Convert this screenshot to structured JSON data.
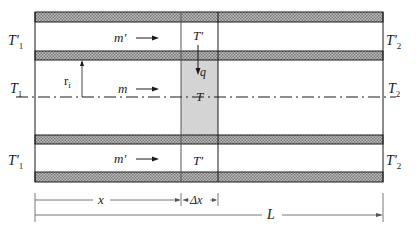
{
  "diagram": {
    "type": "double-pipe heat exchanger control volume",
    "labels": {
      "inlet_outer_top": "T'",
      "inlet_outer_top_sub": "1",
      "outlet_outer_top": "T'",
      "outlet_outer_top_sub": "2",
      "inlet_inner": "T",
      "inlet_inner_sub": "1",
      "outlet_inner": "T",
      "outlet_inner_sub": "2",
      "inlet_outer_bottom": "T'",
      "inlet_outer_bottom_sub": "1",
      "outlet_outer_bottom": "T'",
      "outlet_outer_bottom_sub": "2",
      "flow_outer_top": "m'",
      "flow_inner": "m",
      "flow_outer_bottom": "m'",
      "cv_outer_top_temp": "T'",
      "cv_inner_temp": "T",
      "cv_outer_bottom_temp": "T'",
      "heat_flux": "q",
      "radius": "r",
      "radius_sub": "i",
      "dim_x": "x",
      "dim_dx": "Δx",
      "dim_L": "L"
    },
    "colors": {
      "hatch": "#9a9a9a",
      "cv_fill": "#d4d4d4",
      "line": "#1a1a1a"
    }
  }
}
